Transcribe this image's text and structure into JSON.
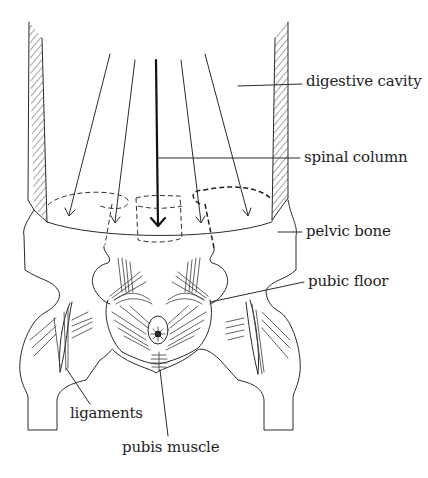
{
  "figure": {
    "labels": {
      "digestive_cavity": "digestive cavity",
      "spinal_column": "spinal column",
      "pelvic_bone": "pelvic bone",
      "pubic_floor": "pubic floor",
      "ligaments": "ligaments",
      "pubis_muscle": "pubis muscle"
    },
    "colors": {
      "line": "#2a2a2a",
      "background": "#ffffff"
    }
  }
}
